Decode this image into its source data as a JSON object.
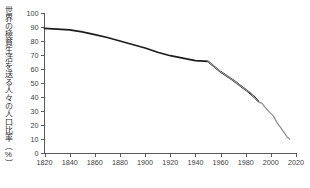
{
  "chart_data": {
    "type": "line",
    "title": "",
    "xlabel": "",
    "ylabel": "世界の極貧生活を送る人々の人口比率（%）",
    "xlim": [
      1820,
      2020
    ],
    "ylim": [
      0,
      100
    ],
    "grid": false,
    "legend_position": "none",
    "x_ticks": [
      "1820",
      "1840",
      "1860",
      "1880",
      "1900",
      "1920",
      "1940",
      "1960",
      "1980",
      "2000",
      "2020"
    ],
    "y_ticks": [
      "0",
      "10",
      "20",
      "30",
      "40",
      "50",
      "60",
      "70",
      "80",
      "90",
      "100"
    ],
    "series": [
      {
        "name": "historic-estimate",
        "color": "#1c1c1c",
        "x": [
          1820,
          1830,
          1840,
          1850,
          1860,
          1870,
          1880,
          1890,
          1900,
          1910,
          1920,
          1929,
          1940,
          1950,
          1960,
          1970,
          1981,
          1987,
          1990
        ],
        "values": [
          89.0,
          88.5,
          88.0,
          86.5,
          84.5,
          82.5,
          80.0,
          77.5,
          75.0,
          72.0,
          69.5,
          68.0,
          66.0,
          65.5,
          58.0,
          52.0,
          44.5,
          40.0,
          37.0
        ]
      },
      {
        "name": "recent-survey-data",
        "color": "#8e8e8e",
        "x": [
          1950,
          1960,
          1970,
          1981,
          1984,
          1987,
          1990,
          1993,
          1996,
          1999,
          2002,
          2005,
          2008,
          2011,
          2013,
          2015
        ],
        "values": [
          65.5,
          58.0,
          52.0,
          44.5,
          43.0,
          39.5,
          36.5,
          35.5,
          32.0,
          29.0,
          26.5,
          21.5,
          18.0,
          14.0,
          11.5,
          10.0
        ]
      }
    ]
  },
  "axis": {
    "y_axis_name": "y-axis",
    "x_axis_name": "x-axis"
  }
}
